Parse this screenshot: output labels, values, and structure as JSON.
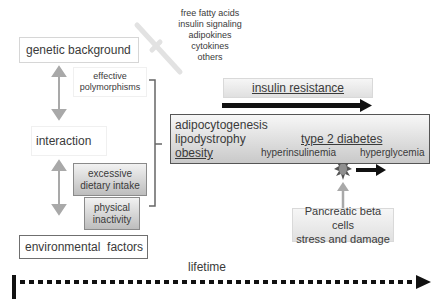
{
  "factors_list": [
    "free fatty acids",
    "insulin signaling",
    "adipokines",
    "cytokines",
    "others"
  ],
  "genetic_background": "genetic background",
  "effective_polymorphisms": [
    "effective",
    "polymorphisms"
  ],
  "interaction": "interaction",
  "excessive_dietary_intake": [
    "excessive",
    "dietary intake"
  ],
  "physical_inactivity": [
    "physical",
    "inactivity"
  ],
  "environmental_factors": "environmental  factors",
  "insulin_resistance": "insulin resistance",
  "main_box": {
    "adipocytogenesis": "adipocytogenesis",
    "lipodystrophy": "lipodystrophy",
    "obesity": "obesity",
    "type2_diabetes": "type 2 diabetes",
    "hyperinsulinemia": "hyperinsulinemia",
    "hyperglycemia": "hyperglycemia"
  },
  "pancreatic": [
    "Pancreatic beta cells",
    "stress and damage"
  ],
  "lifetime": "lifetime",
  "colors": {
    "arrow_gray": "#a9a9a9",
    "arrow_black": "#111111",
    "star_fill": "#8f8f8f"
  }
}
